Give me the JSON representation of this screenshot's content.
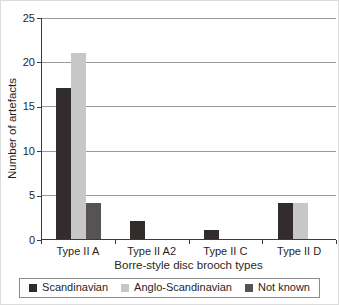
{
  "chart_data": {
    "type": "bar",
    "title": "",
    "xlabel": "Borre-style disc brooch types",
    "ylabel": "Number of artefacts",
    "categories": [
      "Type II A",
      "Type II A2",
      "Type II C",
      "Type II D"
    ],
    "series": [
      {
        "name": "Scandinavian",
        "color": "#322c2c",
        "values": [
          17,
          2,
          1,
          4
        ]
      },
      {
        "name": "Anglo-Scandinavian",
        "color": "#c7c7c7",
        "values": [
          21,
          null,
          null,
          4
        ]
      },
      {
        "name": "Not known",
        "color": "#585353",
        "values": [
          4,
          null,
          null,
          null
        ]
      }
    ],
    "ylim": [
      0,
      25
    ],
    "yticks": [
      0,
      5,
      10,
      15,
      20,
      25
    ],
    "grid": true,
    "legend_position": "bottom"
  },
  "colors": {
    "gridline": "#9a9a9a",
    "axis": "#3a3a3a",
    "text": "#1f1f1f",
    "legend_border": "#8c8c8c",
    "background": "#ffffff"
  }
}
